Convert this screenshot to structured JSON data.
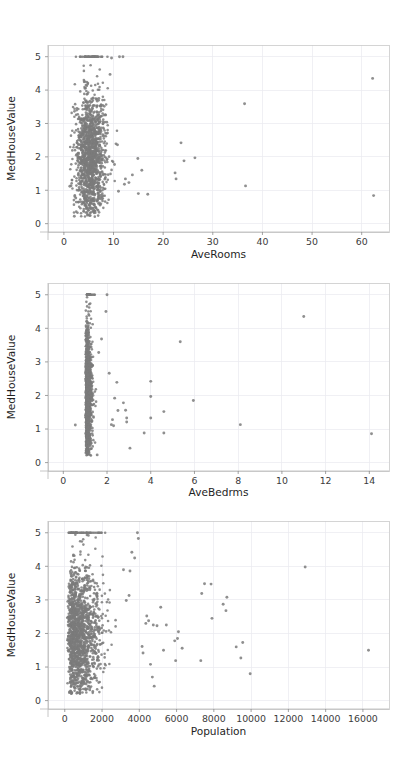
{
  "figure": {
    "background_color": "#ffffff",
    "point_color": "#7b7b7b",
    "grid_color": "#e9e9ef",
    "spine_color": "#c9c9c9",
    "tick_label_color": "#3b3b3b",
    "axis_title_color": "#1f1f1f",
    "panel_count": 3,
    "width": 410,
    "height": 767
  },
  "chart_data": [
    {
      "type": "scatter",
      "title": "",
      "xlabel": "AveRooms",
      "ylabel": "MedHouseValue",
      "xlim": [
        -3.2,
        65.5
      ],
      "ylim": [
        -0.25,
        5.35
      ],
      "xticks": [
        0,
        10,
        20,
        30,
        40,
        50,
        60
      ],
      "xticklabels": [
        "0",
        "10",
        "20",
        "30",
        "40",
        "50",
        "60"
      ],
      "yticks": [
        0,
        1,
        2,
        3,
        4,
        5
      ],
      "yticklabels": [
        "0",
        "1",
        "2",
        "3",
        "4",
        "5"
      ],
      "grid": true,
      "legend": null,
      "marker_size": 1.3,
      "n_points": 1400,
      "cluster": {
        "x_center": 5.4,
        "x_spread": 1.5,
        "x_min": 1.2,
        "x_max": 11.5,
        "y_center": 2.05,
        "y_spread": 0.95,
        "y_min": 0.2,
        "y_max": 5.0
      },
      "cap_value": 5.0,
      "cap_note": "MedHouseValue is censored at 5.0 producing a dense row of points along y=5",
      "outliers": [
        [
          62.2,
          4.35
        ],
        [
          62.4,
          0.84
        ],
        [
          36.4,
          3.59
        ],
        [
          36.6,
          1.13
        ],
        [
          23.6,
          2.42
        ],
        [
          22.4,
          1.52
        ],
        [
          22.6,
          1.34
        ],
        [
          24.2,
          1.88
        ],
        [
          26.4,
          1.97
        ],
        [
          16.9,
          0.88
        ],
        [
          15.0,
          0.9
        ],
        [
          14.9,
          1.95
        ],
        [
          15.7,
          1.6
        ],
        [
          13.8,
          1.46
        ],
        [
          13.1,
          1.23
        ],
        [
          12.4,
          1.34
        ],
        [
          11.9,
          5.0
        ],
        [
          11.2,
          5.0
        ],
        [
          12.2,
          1.18
        ],
        [
          11.0,
          0.97
        ],
        [
          10.5,
          2.39
        ],
        [
          10.8,
          2.36
        ],
        [
          10.2,
          1.77
        ],
        [
          1.2,
          1.12
        ],
        [
          2.1,
          0.22
        ],
        [
          2.4,
          0.77
        ],
        [
          9.6,
          4.96
        ],
        [
          9.3,
          4.47
        ]
      ]
    },
    {
      "type": "scatter",
      "title": "",
      "xlabel": "AveBedrms",
      "ylabel": "MedHouseValue",
      "xlim": [
        -0.7,
        14.9
      ],
      "ylim": [
        -0.25,
        5.35
      ],
      "xticks": [
        0,
        2,
        4,
        6,
        8,
        10,
        12,
        14
      ],
      "xticklabels": [
        "0",
        "2",
        "4",
        "6",
        "8",
        "10",
        "12",
        "14"
      ],
      "yticks": [
        0,
        1,
        2,
        3,
        4,
        5
      ],
      "yticklabels": [
        "0",
        "1",
        "2",
        "3",
        "4",
        "5"
      ],
      "grid": true,
      "legend": null,
      "marker_size": 1.3,
      "n_points": 1200,
      "cluster": {
        "x_center": 1.08,
        "x_spread": 0.16,
        "x_min": 0.55,
        "x_max": 2.3,
        "y_center": 2.05,
        "y_spread": 0.95,
        "y_min": 0.2,
        "y_max": 5.0
      },
      "cap_value": 5.0,
      "cap_note": "MedHouseValue censored at 5.0",
      "outliers": [
        [
          11.0,
          4.35
        ],
        [
          14.1,
          0.86
        ],
        [
          8.1,
          1.13
        ],
        [
          5.35,
          3.6
        ],
        [
          5.95,
          1.85
        ],
        [
          4.0,
          2.42
        ],
        [
          4.0,
          1.33
        ],
        [
          4.0,
          1.97
        ],
        [
          4.6,
          1.52
        ],
        [
          4.6,
          0.88
        ],
        [
          3.7,
          0.88
        ],
        [
          3.05,
          0.43
        ],
        [
          2.9,
          1.33
        ],
        [
          2.9,
          1.21
        ],
        [
          2.85,
          1.56
        ],
        [
          2.75,
          1.78
        ],
        [
          2.5,
          1.55
        ],
        [
          2.35,
          1.92
        ],
        [
          2.3,
          1.1
        ],
        [
          2.25,
          1.28
        ],
        [
          2.2,
          1.13
        ],
        [
          2.45,
          2.39
        ],
        [
          2.1,
          2.66
        ],
        [
          2.0,
          5.0
        ],
        [
          1.95,
          4.5
        ],
        [
          1.75,
          3.68
        ],
        [
          1.62,
          3.28
        ],
        [
          1.55,
          0.23
        ],
        [
          0.55,
          1.12
        ]
      ]
    },
    {
      "type": "scatter",
      "title": "",
      "xlabel": "Population",
      "ylabel": "MedHouseValue",
      "xlim": [
        -900,
        17400
      ],
      "ylim": [
        -0.25,
        5.35
      ],
      "xticks": [
        0,
        2000,
        4000,
        6000,
        8000,
        10000,
        12000,
        14000,
        16000
      ],
      "xticklabels": [
        "0",
        "2000",
        "4000",
        "6000",
        "8000",
        "10000",
        "12000",
        "14000",
        "16000"
      ],
      "yticks": [
        0,
        1,
        2,
        3,
        4,
        5
      ],
      "yticklabels": [
        "0",
        "1",
        "2",
        "3",
        "4",
        "5"
      ],
      "grid": true,
      "legend": null,
      "marker_size": 1.3,
      "n_points": 1500,
      "cluster": {
        "x_center": 1280,
        "x_spread": 830,
        "x_min": 120,
        "x_max": 4100,
        "y_center": 2.0,
        "y_spread": 0.95,
        "y_min": 0.2,
        "y_max": 5.0
      },
      "cap_value": 5.0,
      "cap_note": "MedHouseValue censored at 5.0",
      "outliers": [
        [
          12900,
          3.98
        ],
        [
          16300,
          1.5
        ],
        [
          9950,
          0.8
        ],
        [
          9450,
          1.27
        ],
        [
          9200,
          1.6
        ],
        [
          9550,
          1.73
        ],
        [
          8700,
          3.08
        ],
        [
          8650,
          2.68
        ],
        [
          8500,
          2.87
        ],
        [
          7900,
          2.45
        ],
        [
          7850,
          3.47
        ],
        [
          7500,
          3.48
        ],
        [
          7350,
          3.19
        ],
        [
          7300,
          1.19
        ],
        [
          6300,
          1.56
        ],
        [
          6100,
          2.05
        ],
        [
          6050,
          1.85
        ],
        [
          5900,
          1.78
        ],
        [
          5950,
          1.19
        ],
        [
          5450,
          2.25
        ],
        [
          5300,
          1.5
        ],
        [
          5150,
          2.78
        ],
        [
          4950,
          2.23
        ],
        [
          4800,
          0.43
        ],
        [
          4700,
          0.7
        ],
        [
          4750,
          2.25
        ],
        [
          4600,
          1.08
        ],
        [
          4500,
          2.38
        ],
        [
          4400,
          2.52
        ],
        [
          4350,
          2.3
        ],
        [
          4200,
          1.42
        ],
        [
          4150,
          1.61
        ],
        [
          3950,
          4.83
        ],
        [
          3900,
          5.0
        ],
        [
          3750,
          4.25
        ],
        [
          3600,
          4.42
        ],
        [
          3500,
          3.86
        ],
        [
          3450,
          3.13
        ],
        [
          3300,
          2.98
        ],
        [
          3150,
          3.9
        ]
      ]
    }
  ],
  "panels": [
    {
      "id": "panel-averooms",
      "x_axis_label": "AveRooms",
      "y_axis_label": "MedHouseValue"
    },
    {
      "id": "panel-avebedrms",
      "x_axis_label": "AveBedrms",
      "y_axis_label": "MedHouseValue"
    },
    {
      "id": "panel-population",
      "x_axis_label": "Population",
      "y_axis_label": "MedHouseValue"
    }
  ]
}
